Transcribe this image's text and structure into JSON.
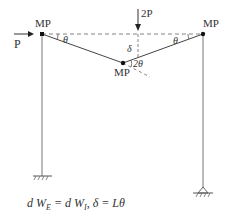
{
  "diagram": {
    "type": "portal frame plastic collapse mechanism (combined mechanism)",
    "labels": {
      "horizontal_load": "P",
      "vertical_load": "2P",
      "plastic_moment_left": "MP",
      "plastic_moment_right": "MP",
      "plastic_moment_mid": "MP",
      "rotation_left": "θ",
      "rotation_right": "θ",
      "rotation_mid": "2θ",
      "deflection": "δ"
    },
    "supports": {
      "left": "fixed",
      "right": "pinned"
    },
    "equation": "dW_E = dW_I,  δ = Lθ"
  },
  "equation_parts": {
    "lhs": "d W",
    "lhs_sub": "E",
    "eq1": " = d W",
    "rhs_sub": "I",
    "rest": ",  δ = Lθ"
  },
  "colors": {
    "line": "#555555",
    "text": "#333333",
    "node": "#111111"
  }
}
